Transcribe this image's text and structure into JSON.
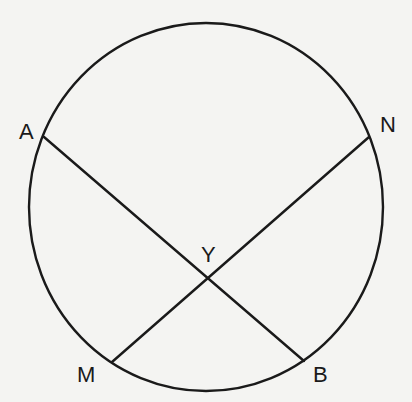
{
  "diagram": {
    "type": "geometry-circle-intersecting-chords",
    "colors": {
      "stroke": "#1a1a1a",
      "background": "#f4f4f2"
    },
    "circle": {
      "cx": 206,
      "cy": 207,
      "rx": 177,
      "ry": 184
    },
    "points": {
      "A": {
        "label": "A",
        "x": 44,
        "y": 137
      },
      "N": {
        "label": "N",
        "x": 369,
        "y": 137
      },
      "M": {
        "label": "M",
        "x": 112,
        "y": 362
      },
      "B": {
        "label": "B",
        "x": 304,
        "y": 361
      },
      "Y": {
        "label": "Y",
        "x": 208,
        "y": 278
      }
    },
    "chords": [
      {
        "name": "AB",
        "from": "A",
        "to": "B"
      },
      {
        "name": "MN",
        "from": "M",
        "to": "N"
      }
    ],
    "labels": {
      "A": "A",
      "N": "N",
      "M": "M",
      "B": "B",
      "Y": "Y"
    }
  }
}
